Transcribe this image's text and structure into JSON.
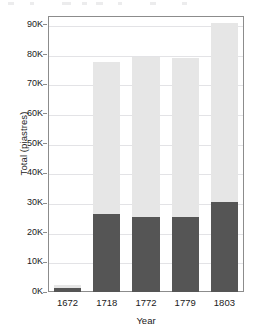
{
  "chart_data": {
    "type": "bar",
    "title": "",
    "subtitle": "",
    "xlabel": "Year",
    "ylabel": "Total (piastres)",
    "categories": [
      "1672",
      "1718",
      "1772",
      "1779",
      "1803"
    ],
    "series": [
      {
        "name": "lower-segment",
        "color": "#555555",
        "values": [
          1300,
          26200,
          25300,
          25400,
          30200
        ]
      },
      {
        "name": "upper-segment",
        "color": "#e6e6e6",
        "values": [
          1100,
          51300,
          54000,
          53600,
          60400
        ]
      }
    ],
    "totals": [
      2400,
      77500,
      79300,
      79000,
      90600
    ],
    "stacked": true,
    "ylim": [
      0,
      93000
    ],
    "xlim_categories": 5,
    "y_ticks": [
      0,
      10000,
      20000,
      30000,
      40000,
      50000,
      60000,
      70000,
      80000,
      90000
    ],
    "y_tick_labels": [
      "0K",
      "10K",
      "20K",
      "30K",
      "40K",
      "50K",
      "60K",
      "70K",
      "80K",
      "90K"
    ],
    "grid": true,
    "grid_axis": "y",
    "grid_color": "#e3e3e6",
    "legend": false,
    "legend_position": "none",
    "frame_color": "#8c8c8c",
    "background": "#ffffff",
    "annotations": []
  },
  "figure": {
    "y_axis_label": "Total (piastres)",
    "x_axis_label": "Year"
  }
}
